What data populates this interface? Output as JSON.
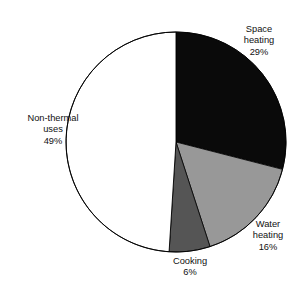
{
  "chart_data": {
    "type": "pie",
    "title": "",
    "xlabel": "",
    "ylabel": "",
    "legend_position": "none",
    "grid": false,
    "start_angle_deg": 0,
    "direction": "clockwise",
    "units": "percent",
    "total": 100,
    "categories": [
      "Space heating",
      "Water heating",
      "Cooking",
      "Non-thermal uses"
    ],
    "values": [
      29,
      16,
      6,
      49
    ],
    "labels": [
      "29%",
      "16%",
      "6%",
      "49%"
    ],
    "colors": [
      "#0a0a0a",
      "#989898",
      "#555555",
      "#ffffff"
    ],
    "slices": [
      {
        "name": "Space heating",
        "value": 29,
        "label": "29%",
        "color": "#0a0a0a",
        "start_deg": 0,
        "end_deg": 104.4
      },
      {
        "name": "Water heating",
        "value": 16,
        "label": "16%",
        "color": "#989898",
        "start_deg": 104.4,
        "end_deg": 162.0
      },
      {
        "name": "Cooking",
        "value": 6,
        "label": "6%",
        "color": "#555555",
        "start_deg": 162.0,
        "end_deg": 183.6
      },
      {
        "name": "Non-thermal uses",
        "value": 49,
        "label": "49%",
        "color": "#ffffff",
        "start_deg": 183.6,
        "end_deg": 360.0
      }
    ]
  },
  "title": {
    "text": ""
  },
  "labels": {
    "space_heating": {
      "name": "Space\nheating",
      "name_line1": "Space",
      "name_line2": "heating",
      "value": "29%"
    },
    "water_heating": {
      "name_line1": "Water",
      "name_line2": "heating",
      "value": "16%"
    },
    "cooking": {
      "name_line1": "Cooking",
      "name_line2": "",
      "value": "6%"
    },
    "non_thermal": {
      "name_line1": "Non-thermal",
      "name_line2": "uses",
      "value": "49%"
    }
  },
  "geometry": {
    "center_x": 176,
    "center_y": 142,
    "radius": 110,
    "outline_color": "#000000"
  }
}
